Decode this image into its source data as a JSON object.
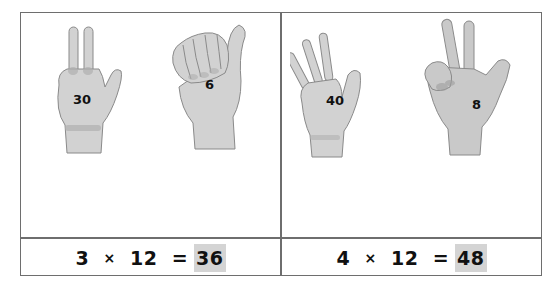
{
  "panels": [
    {
      "hands": [
        {
          "label": "30",
          "gesture": "three-fingers-up",
          "icon": "hand-three-icon"
        },
        {
          "label": "6",
          "gesture": "closed-fist-thumb-up",
          "icon": "hand-fist-thumb-icon"
        }
      ],
      "equation": {
        "left": "3",
        "operator": "×",
        "right": "12",
        "equals": "=",
        "answer": "36"
      }
    },
    {
      "hands": [
        {
          "label": "40",
          "gesture": "four-fingers-and-thumb",
          "icon": "hand-open-icon"
        },
        {
          "label": "8",
          "gesture": "two-fingers-up-thumb-out",
          "icon": "hand-two-thumb-icon"
        }
      ],
      "equation": {
        "left": "4",
        "operator": "×",
        "right": "12",
        "equals": "=",
        "answer": "48"
      }
    }
  ],
  "colors": {
    "border": "#6e6e6e",
    "answer_highlight": "#d4d4d4",
    "skin": "#cfcfcf",
    "skin_shadow": "#a8a8a8"
  }
}
